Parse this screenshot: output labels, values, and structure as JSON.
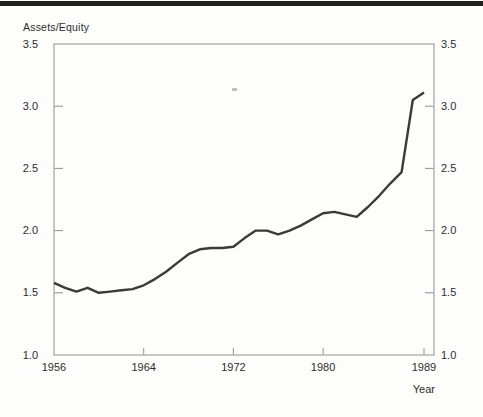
{
  "chart_data": {
    "type": "line",
    "title": "Assets/Equity",
    "xlabel": "Year",
    "x": [
      1956,
      1957,
      1958,
      1959,
      1960,
      1961,
      1962,
      1963,
      1964,
      1965,
      1966,
      1967,
      1968,
      1969,
      1970,
      1971,
      1972,
      1973,
      1974,
      1975,
      1976,
      1977,
      1978,
      1979,
      1980,
      1981,
      1982,
      1983,
      1984,
      1985,
      1986,
      1987,
      1988,
      1989
    ],
    "values": [
      1.58,
      1.54,
      1.51,
      1.54,
      1.5,
      1.51,
      1.52,
      1.53,
      1.56,
      1.61,
      1.67,
      1.74,
      1.81,
      1.85,
      1.86,
      1.86,
      1.87,
      1.94,
      2.0,
      2.0,
      1.97,
      2.0,
      2.04,
      2.09,
      2.14,
      2.15,
      2.13,
      2.11,
      2.19,
      2.28,
      2.38,
      2.47,
      3.05,
      3.11
    ],
    "xticks": [
      1956,
      1964,
      1972,
      1980,
      1989
    ],
    "xtick_labels": [
      "1956",
      "1964",
      "1972",
      "1980",
      "1989"
    ],
    "yticks": [
      1.0,
      1.5,
      2.0,
      2.5,
      3.0,
      3.5
    ],
    "ytick_labels": [
      "1.0",
      "1.5",
      "2.0",
      "2.5",
      "3.0",
      "3.5"
    ],
    "ylim": [
      1.0,
      3.5
    ],
    "xlim": [
      1956,
      1990
    ],
    "grid": false,
    "legend": "none",
    "y_axis_sides": "both",
    "line_color": "#3a3a3a",
    "axis_color": "#8f8f8f",
    "text_color": "#2d2d2d"
  }
}
